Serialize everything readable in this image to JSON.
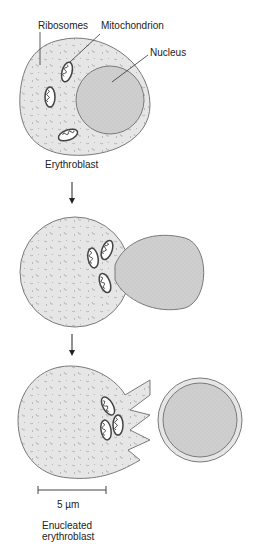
{
  "labels": {
    "ribosomes": "Ribosomes",
    "mitochondrion": "Mitochondrion",
    "nucleus": "Nucleus",
    "erythroblast": "Erythroblast",
    "scale": "5 µm",
    "enucleated_line1": "Enucleated",
    "enucleated_line2": "erythroblast"
  },
  "stages": [
    {
      "name": "Erythroblast"
    },
    {
      "name": "Nucleus extrusion"
    },
    {
      "name": "Enucleated erythroblast"
    }
  ],
  "colors": {
    "cytoplasm": "#e6e6e6",
    "nucleus": "#cfcfcf",
    "outline": "#7a7a7a",
    "text": "#222222"
  }
}
